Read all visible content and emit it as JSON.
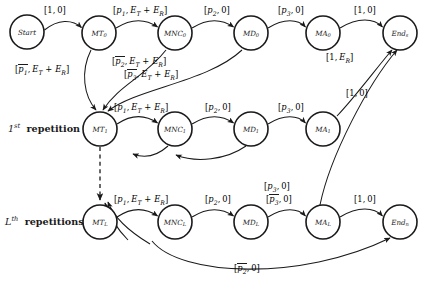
{
  "diagram": {
    "type": "state-transition-diagram",
    "title": "",
    "row_captions": [
      {
        "id": "caption-first-repetition",
        "ordinal": "1",
        "ordinal_suffix": "st",
        "text": "repetition",
        "x": 8,
        "y": 125
      },
      {
        "id": "caption-lth-repetitions",
        "ordinal": "L",
        "ordinal_suffix": "th",
        "text": "repetitions",
        "x": 5,
        "y": 218
      }
    ],
    "nodes": [
      {
        "id": "start",
        "label": "Start",
        "sub": "",
        "x": 27,
        "y": 32,
        "r": 17
      },
      {
        "id": "mt0",
        "label": "MT",
        "sub": "0",
        "x": 99,
        "y": 33,
        "r": 17
      },
      {
        "id": "mnc0",
        "label": "MNC",
        "sub": "0",
        "x": 175,
        "y": 33,
        "r": 17
      },
      {
        "id": "md0",
        "label": "MD",
        "sub": "0",
        "x": 251,
        "y": 33,
        "r": 17
      },
      {
        "id": "ma0",
        "label": "MA",
        "sub": "0",
        "x": 323,
        "y": 33,
        "r": 17
      },
      {
        "id": "ends",
        "label": "End",
        "sub": "s",
        "x": 400,
        "y": 33,
        "r": 17
      },
      {
        "id": "mt1",
        "label": "MT",
        "sub": "1",
        "x": 100,
        "y": 129,
        "r": 17
      },
      {
        "id": "mnc1",
        "label": "MNC",
        "sub": "1",
        "x": 175,
        "y": 129,
        "r": 17
      },
      {
        "id": "md1",
        "label": "MD",
        "sub": "1",
        "x": 251,
        "y": 129,
        "r": 17
      },
      {
        "id": "ma1",
        "label": "MA",
        "sub": "1",
        "x": 323,
        "y": 129,
        "r": 17
      },
      {
        "id": "mtl",
        "label": "MT",
        "sub": "L",
        "x": 100,
        "y": 222,
        "r": 17
      },
      {
        "id": "mncl",
        "label": "MNC",
        "sub": "L",
        "x": 175,
        "y": 222,
        "r": 17
      },
      {
        "id": "mdl",
        "label": "MD",
        "sub": "L",
        "x": 251,
        "y": 222,
        "r": 17
      },
      {
        "id": "mal",
        "label": "MA",
        "sub": "L",
        "x": 323,
        "y": 222,
        "r": 17
      },
      {
        "id": "endn",
        "label": "End",
        "sub": "n",
        "x": 400,
        "y": 222,
        "r": 17
      }
    ],
    "edge_labels": [
      {
        "id": "lbl-start-mt0",
        "text": "[1, 0]",
        "p": "",
        "bar": false,
        "energy": false,
        "x": 44,
        "y": 8
      },
      {
        "id": "lbl-mt0-mnc0",
        "text": "[p1, ET + ER]",
        "p": "1",
        "bar": false,
        "energy": true,
        "x": 116,
        "y": 8
      },
      {
        "id": "lbl-mnc0-md0",
        "text": "[p2, 0]",
        "p": "2",
        "bar": false,
        "energy": false,
        "x": 206,
        "y": 8
      },
      {
        "id": "lbl-md0-ma0",
        "text": "[p3, 0]",
        "p": "3",
        "bar": false,
        "energy": false,
        "x": 280,
        "y": 8
      },
      {
        "id": "lbl-ma0-ends",
        "text": "[1, 0]",
        "p": "",
        "bar": false,
        "energy": false,
        "x": 355,
        "y": 8
      },
      {
        "id": "lbl-mt0-mt1",
        "text": "[p1bar, ET + ER]",
        "p": "1",
        "bar": true,
        "energy": true,
        "x": 16,
        "y": 66
      },
      {
        "id": "lbl-mnc0-mt1",
        "text": "[p2bar, ET + ER]",
        "p": "2",
        "bar": true,
        "energy": true,
        "x": 113,
        "y": 58
      },
      {
        "id": "lbl-md0-mt1",
        "text": "[p3bar, ET + ER]",
        "p": "3",
        "bar": true,
        "energy": true,
        "x": 126,
        "y": 71
      },
      {
        "id": "lbl-ma0-ends-er",
        "text": "[1, ER]",
        "p": "",
        "bar": false,
        "energy": false,
        "x": 328,
        "y": 55
      },
      {
        "id": "lbl-ma1-ends",
        "text": "[1, 0]",
        "p": "",
        "bar": false,
        "energy": false,
        "x": 348,
        "y": 91
      },
      {
        "id": "lbl-mt1-mnc1",
        "text": "[p1, ET + ER]",
        "p": "1",
        "bar": false,
        "energy": true,
        "x": 117,
        "y": 105
      },
      {
        "id": "lbl-mnc1-md1",
        "text": "[p2, 0]",
        "p": "2",
        "bar": false,
        "energy": false,
        "x": 207,
        "y": 105
      },
      {
        "id": "lbl-md1-ma1",
        "text": "[p3, 0]",
        "p": "3",
        "bar": false,
        "energy": false,
        "x": 280,
        "y": 105
      },
      {
        "id": "lbl-ma1-endn",
        "text": "[p3, 0]",
        "p": "3",
        "bar": false,
        "energy": false,
        "x": 266,
        "y": 184
      },
      {
        "id": "lbl-mtl-mncl",
        "text": "[p1, ET + ER]",
        "p": "1",
        "bar": false,
        "energy": true,
        "x": 117,
        "y": 197
      },
      {
        "id": "lbl-mncl-mdl",
        "text": "[p2, 0]",
        "p": "2",
        "bar": false,
        "energy": false,
        "x": 207,
        "y": 197
      },
      {
        "id": "lbl-mdl-mal",
        "text": "[p3bar, 0]",
        "p": "3",
        "bar": true,
        "energy": false,
        "x": 268,
        "y": 196
      },
      {
        "id": "lbl-mal-endn",
        "text": "[1, 0]",
        "p": "",
        "bar": false,
        "energy": false,
        "x": 355,
        "y": 197
      },
      {
        "id": "lbl-bottom-p2bar",
        "text": "[p2bar, 0]",
        "p": "2",
        "bar": true,
        "energy": false,
        "x": 236,
        "y": 265
      }
    ],
    "symbols": {
      "energy_text": ", ET + ER]",
      "zero_text": ", 0]",
      "open_bracket": "["
    }
  }
}
